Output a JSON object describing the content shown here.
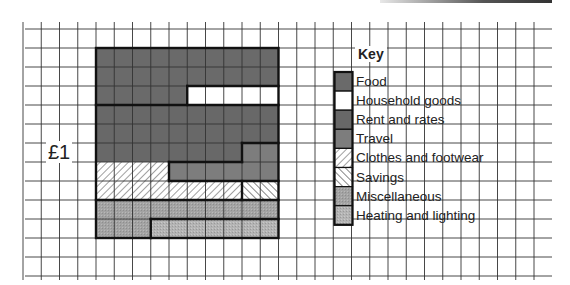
{
  "chart_data": {
    "type": "table",
    "subtype": "10x10 hundred-square grid (each square = 1p)",
    "title": "",
    "total_label": "£1",
    "total_squares": 100,
    "grid": {
      "rows": 10,
      "cols": 10
    },
    "legend_title": "Key",
    "legend_position": "right",
    "categories": [
      "Food",
      "Household goods",
      "Rent and rates",
      "Travel",
      "Clothes and footwear",
      "Savings",
      "Miscellaneous",
      "Heating and lighting"
    ],
    "values": [
      25,
      5,
      28,
      8,
      12,
      2,
      13,
      7
    ],
    "unit": "pence (squares out of 100)",
    "regions": [
      {
        "name": "Food",
        "cells": [
          [
            0,
            0,
            10
          ],
          [
            1,
            0,
            10
          ],
          [
            2,
            0,
            5
          ]
        ]
      },
      {
        "name": "Household goods",
        "cells": [
          [
            2,
            5,
            5
          ]
        ]
      },
      {
        "name": "Rent and rates",
        "cells": [
          [
            3,
            0,
            10
          ],
          [
            4,
            0,
            10
          ],
          [
            5,
            0,
            8
          ]
        ]
      },
      {
        "name": "Travel",
        "cells": [
          [
            5,
            8,
            2
          ],
          [
            6,
            4,
            6
          ]
        ]
      },
      {
        "name": "Clothes and footwear",
        "cells": [
          [
            6,
            0,
            4
          ],
          [
            7,
            0,
            8
          ]
        ]
      },
      {
        "name": "Savings",
        "cells": [
          [
            7,
            8,
            2
          ]
        ]
      },
      {
        "name": "Miscellaneous",
        "cells": [
          [
            8,
            0,
            10
          ],
          [
            9,
            0,
            3
          ]
        ]
      },
      {
        "name": "Heating and lighting",
        "cells": [
          [
            9,
            3,
            7
          ]
        ]
      }
    ]
  },
  "key": {
    "title": "Key",
    "items": [
      {
        "label": "Food",
        "fill": "#6a6a6a",
        "pattern": "solid"
      },
      {
        "label": "Household goods",
        "fill": "#ffffff",
        "pattern": "solid"
      },
      {
        "label": "Rent and rates",
        "fill": "#686868",
        "pattern": "solid"
      },
      {
        "label": "Travel",
        "fill": "#7d7d7d",
        "pattern": "solid"
      },
      {
        "label": "Clothes and footwear",
        "fill": "#ffffff",
        "pattern": "hatch-forward"
      },
      {
        "label": "Savings",
        "fill": "#ffffff",
        "pattern": "hatch-back"
      },
      {
        "label": "Miscellaneous",
        "fill": "#a3a3a3",
        "pattern": "stipple"
      },
      {
        "label": "Heating and lighting",
        "fill": "#b4b4b4",
        "pattern": "stipple"
      }
    ]
  },
  "axis_label": "£1"
}
